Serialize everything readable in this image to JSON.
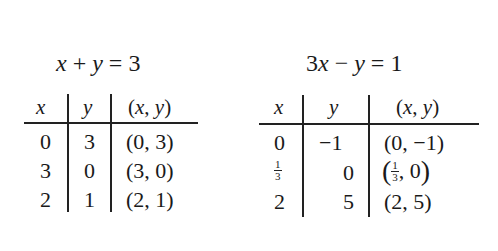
{
  "tables": [
    {
      "equation": "x + y = 3",
      "headers": [
        "x",
        "y",
        "(x, y)"
      ],
      "rows": [
        {
          "x": "0",
          "y": "3",
          "pair": "(0, 3)"
        },
        {
          "x": "3",
          "y": "0",
          "pair": "(3, 0)"
        },
        {
          "x": "2",
          "y": "1",
          "pair": "(2, 1)"
        }
      ]
    },
    {
      "equation": "3x − y = 1",
      "headers": [
        "x",
        "y",
        "(x, y)"
      ],
      "rows": [
        {
          "x": "0",
          "y": "−1",
          "pair": "(0, −1)"
        },
        {
          "x_num": "1",
          "x_den": "3",
          "y": "0",
          "pair_num": "1",
          "pair_den": "3",
          "pair_rest": ", 0"
        },
        {
          "x": "2",
          "y": "5",
          "pair": "(2, 5)"
        }
      ]
    }
  ]
}
